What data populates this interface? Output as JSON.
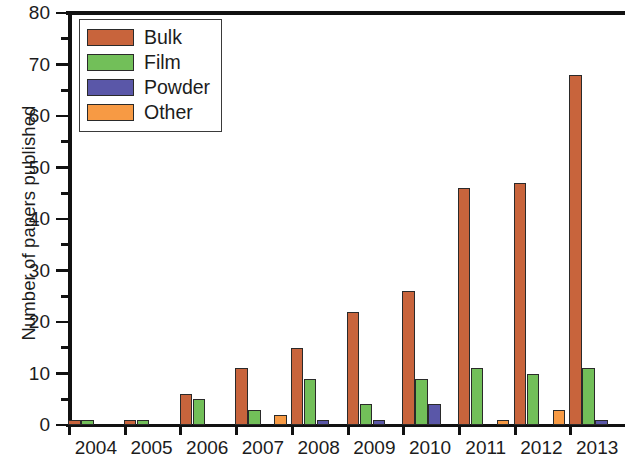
{
  "chart_data": {
    "type": "bar",
    "title": "",
    "xlabel": "",
    "ylabel": "Number of papers published",
    "categories": [
      "2004",
      "2005",
      "2006",
      "2007",
      "2008",
      "2009",
      "2010",
      "2011",
      "2012",
      "2013"
    ],
    "series": [
      {
        "name": "Bulk",
        "color": "#c8643c",
        "values": [
          1,
          1,
          6,
          11,
          15,
          22,
          26,
          46,
          47,
          68
        ]
      },
      {
        "name": "Film",
        "color": "#72bf59",
        "values": [
          1,
          1,
          5,
          3,
          9,
          4,
          9,
          11,
          10,
          11
        ]
      },
      {
        "name": "Powder",
        "color": "#5a57a8",
        "values": [
          0,
          0,
          0,
          0,
          1,
          1,
          4,
          0,
          0,
          1
        ]
      },
      {
        "name": "Other",
        "color": "#f79a44",
        "values": [
          0,
          0,
          0,
          2,
          0,
          0,
          0,
          1,
          3,
          0
        ]
      }
    ],
    "ylim": [
      0,
      80
    ],
    "yticks_major": [
      0,
      10,
      20,
      30,
      40,
      50,
      60,
      70,
      80
    ],
    "yticks_minor": [
      5,
      15,
      25,
      35,
      45,
      55,
      65,
      75
    ],
    "ytick_labels": [
      "0",
      "10",
      "20",
      "30",
      "40",
      "50",
      "60",
      "70",
      "80"
    ],
    "grid": false,
    "legend_position": "top-left",
    "legend_entries": [
      "Bulk",
      "Film",
      "Powder",
      "Other"
    ]
  }
}
